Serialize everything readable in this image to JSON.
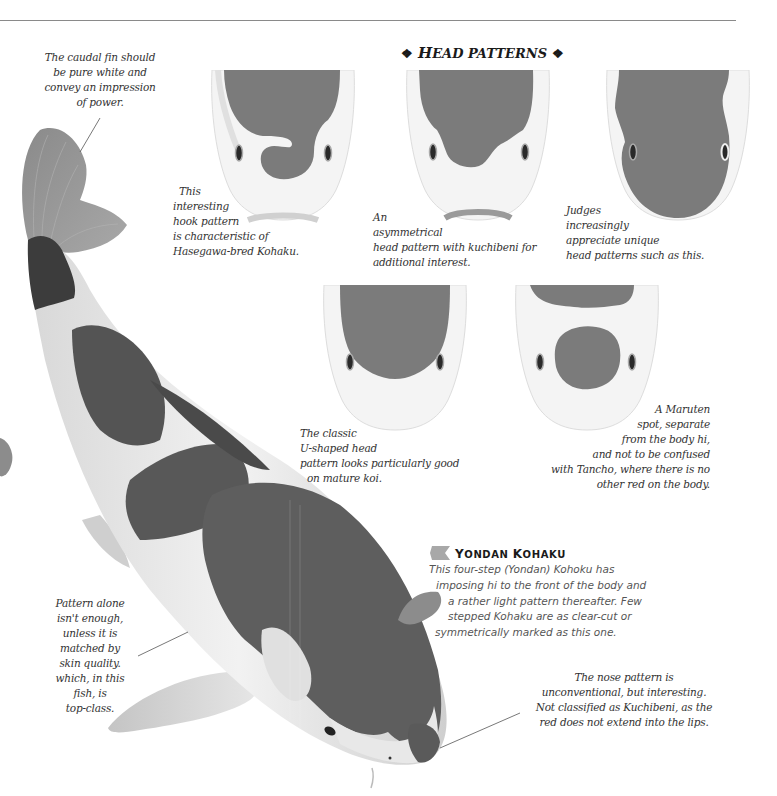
{
  "section": {
    "title_first": "H",
    "title_rest": "EAD PATTERNS",
    "ornament": "❖"
  },
  "captions": {
    "caudal_fin": [
      "The caudal fin should",
      "be pure white and",
      "convey an impression",
      "of power."
    ],
    "hook": [
      "This",
      "interesting",
      "hook pattern",
      "is characteristic of",
      "Hasegawa-bred Kohaku."
    ],
    "asymmetrical": [
      "An",
      "asymmetrical",
      "head pattern with kuchibeni for",
      "additional interest."
    ],
    "judges": [
      "Judges",
      "increasingly",
      "appreciate unique",
      "head patterns such as this."
    ],
    "classic": [
      "The classic",
      "U-shaped head",
      "pattern looks particularly good",
      "on mature koi."
    ],
    "maruten": [
      "A Maruten",
      "spot, separate",
      "from the body hi,",
      "and not to be confused",
      "with Tancho, where there is no",
      "other red on the body."
    ],
    "pattern_alone": [
      "Pattern alone",
      "isn't enough,",
      "unless it is",
      "matched by",
      "skin quality.",
      "which, in this",
      "fish, is",
      "top-class."
    ],
    "nose": [
      "The nose pattern is",
      "unconventional, but interesting.",
      "Not classified as Kuchibeni, as the",
      "red does not extend into the lips."
    ]
  },
  "yondan": {
    "title_first_1": "Y",
    "title_rest_1": "ONDAN ",
    "title_first_2": "K",
    "title_rest_2": "OHAKU",
    "lines": [
      "This four-step (Yondan) Kohoku has",
      "imposing hi to the front of the body and",
      "a rather light pattern thereafter. Few",
      "stepped Kohaku are as clear-cut or",
      "symmetrically marked as this one."
    ]
  },
  "colors": {
    "hi_gray": "#7b7b7b",
    "body_dark": "#585858",
    "rule": "#8a8a8a"
  }
}
